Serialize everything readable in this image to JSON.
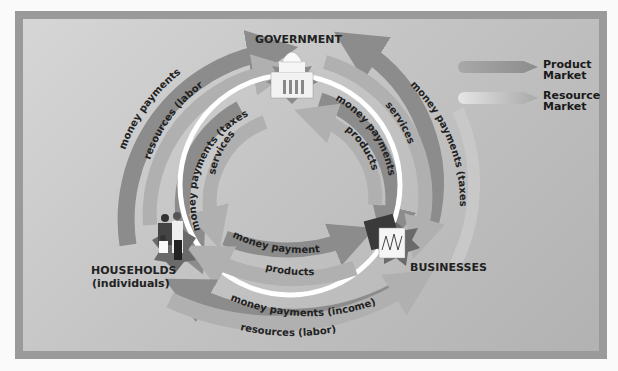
{
  "colors": {
    "background": "#c4c4c4",
    "arrow_product": "#8c8c8c",
    "arrow_resource": "#b5b5b5",
    "ring": "#ffffff",
    "text": "#222222"
  },
  "nodes": {
    "government": {
      "label": "GOVERNMENT",
      "icon": "capitol-building-icon"
    },
    "households": {
      "label": "HOUSEHOLDS",
      "sublabel": "(individuals)",
      "icon": "family-icon"
    },
    "businesses": {
      "label": "BUSINESSES",
      "icon": "briefcase-chart-icon"
    }
  },
  "flows": {
    "hh_to_gov_money": "money payments",
    "hh_to_gov_resources": "resources (labor)",
    "gov_to_hh_taxes": "money payments (taxes)",
    "gov_to_hh_services": "services",
    "gov_to_bus_money": "money payments",
    "bus_to_gov_products": "products",
    "bus_to_gov_taxes": "money payments (taxes)",
    "gov_to_bus_services": "services",
    "hh_to_bus_money": "money payments",
    "bus_to_hh_products": "products",
    "bus_to_hh_income": "money payments (income)",
    "hh_to_bus_resources": "resources (labor)"
  },
  "legend": [
    {
      "label_line1": "Product",
      "label_line2": "Market",
      "color": "#8c8c8c"
    },
    {
      "label_line1": "Resource",
      "label_line2": "Market",
      "color": "#b5b5b5"
    }
  ]
}
